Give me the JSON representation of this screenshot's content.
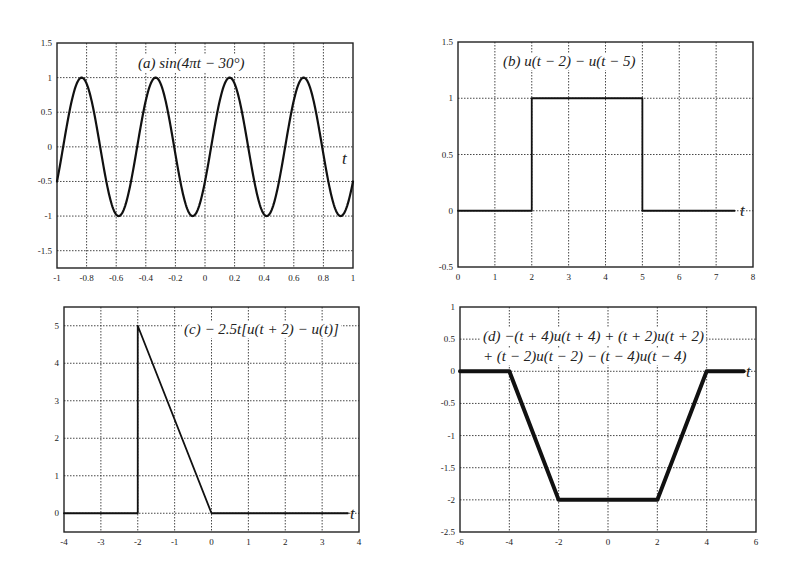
{
  "figure": {
    "background": "#ffffff",
    "line_color": "#111111"
  },
  "chart_data": [
    {
      "id": "a",
      "type": "line",
      "title": "(a) sin(4πt − 30°)",
      "title_prefix": "(a)",
      "title_expr": "sin(4πt − 30°)",
      "xlabel": "t",
      "ylabel": "",
      "xlim": [
        -1,
        1
      ],
      "ylim": [
        -1.75,
        1.5
      ],
      "xticks": [
        -1,
        -0.8,
        -0.6,
        -0.4,
        -0.2,
        0,
        0.2,
        0.4,
        0.6,
        0.8,
        1
      ],
      "xtick_labels": [
        "-1",
        "-0.8",
        "-0.6",
        "-0.4",
        "-0.2",
        "0",
        "0.2",
        "0.4",
        "0.6",
        "0.8",
        "1"
      ],
      "yticks": [
        -1.5,
        -1,
        -0.5,
        0,
        0.5,
        1,
        1.5
      ],
      "ytick_labels": [
        "-1.5",
        "-1",
        "-0.5",
        "0",
        "0.5",
        "1",
        "1.5"
      ],
      "grid": true,
      "function": "sin(4*pi*t - pi/6)",
      "series": [
        {
          "name": "sin(4πt − 30°)",
          "x": [
            -1,
            -0.9167,
            -0.8333,
            -0.75,
            -0.6667,
            -0.5833,
            -0.5,
            -0.4167,
            -0.3333,
            -0.25,
            -0.1667,
            -0.0833,
            0,
            0.0833,
            0.1667,
            0.25,
            0.3333,
            0.4167,
            0.5,
            0.5833,
            0.6667,
            0.75,
            0.8333,
            0.9167,
            1
          ],
          "y": [
            -0.5,
            0.5,
            1,
            0.5,
            -0.5,
            -1,
            -0.5,
            0.5,
            1,
            0.5,
            -0.5,
            -1,
            -0.5,
            0.5,
            1,
            0.5,
            -0.5,
            -1,
            -0.5,
            0.5,
            1,
            0.5,
            -0.5,
            -1,
            -0.5
          ]
        }
      ],
      "box": {
        "x0": 57,
        "y0": 43,
        "x1": 353,
        "y1": 268
      },
      "stroke_width": 2.2,
      "title_pos": {
        "x": 138,
        "y": 68
      },
      "tlabel_pos": {
        "x": 342,
        "y": 164
      }
    },
    {
      "id": "b",
      "type": "line",
      "title": "(b) u(t − 2) − u(t − 5)",
      "title_prefix": "(b)",
      "title_expr": "u(t − 2) − u(t − 5)",
      "xlabel": "t",
      "ylabel": "",
      "xlim": [
        0,
        8
      ],
      "ylim": [
        -0.5,
        1.5
      ],
      "xticks": [
        0,
        1,
        2,
        3,
        4,
        5,
        6,
        7,
        8
      ],
      "xtick_labels": [
        "0",
        "1",
        "2",
        "3",
        "4",
        "5",
        "6",
        "7",
        "8"
      ],
      "yticks": [
        -0.5,
        0,
        0.5,
        1,
        1.5
      ],
      "ytick_labels": [
        "-0.5",
        "0",
        "0.5",
        "1",
        "1.5"
      ],
      "grid": true,
      "series": [
        {
          "name": "u(t−2) − u(t−5)",
          "x": [
            0,
            2,
            2,
            5,
            5,
            7.5
          ],
          "y": [
            0,
            0,
            1,
            1,
            0,
            0
          ]
        }
      ],
      "box": {
        "x0": 458,
        "y0": 42,
        "x1": 753,
        "y1": 267
      },
      "stroke_width": 1.8,
      "title_pos": {
        "x": 503,
        "y": 66
      },
      "tlabel_pos": {
        "x": 740,
        "y": 216
      }
    },
    {
      "id": "c",
      "type": "line",
      "title": "(c) − 2.5t[u(t + 2) − u(t)]",
      "title_prefix": "(c)",
      "title_expr": "− 2.5t[u(t + 2) − u(t)]",
      "xlabel": "t",
      "ylabel": "",
      "xlim": [
        -4,
        4
      ],
      "ylim": [
        -0.5,
        5.5
      ],
      "xticks": [
        -4,
        -3,
        -2,
        -1,
        0,
        1,
        2,
        3,
        4
      ],
      "xtick_labels": [
        "-4",
        "-3",
        "-2",
        "-1",
        "0",
        "1",
        "2",
        "3",
        "4"
      ],
      "yticks": [
        0,
        1,
        2,
        3,
        4,
        5
      ],
      "ytick_labels": [
        "0",
        "1",
        "2",
        "3",
        "4",
        "5"
      ],
      "grid": true,
      "series": [
        {
          "name": "−2.5t[u(t+2) − u(t)]",
          "x": [
            -4,
            -2,
            -2,
            0,
            3.7
          ],
          "y": [
            0,
            0,
            5,
            0,
            0
          ]
        }
      ],
      "box": {
        "x0": 64,
        "y0": 307,
        "x1": 359,
        "y1": 532
      },
      "stroke_width": 1.8,
      "title_pos": {
        "x": 184,
        "y": 334
      },
      "tlabel_pos": {
        "x": 350,
        "y": 519
      }
    },
    {
      "id": "d",
      "type": "line",
      "title": "(d) −(t + 4)u(t + 4) + (t + 2)u(t + 2) + (t − 2)u(t − 2) − (t − 4)u(t − 4)",
      "title_prefix": "(d)",
      "title_expr_line1": "−(t + 4)u(t + 4) + (t + 2)u(t + 2)",
      "title_expr_line2": "+ (t − 2)u(t − 2) − (t − 4)u(t − 4)",
      "xlabel": "t",
      "ylabel": "",
      "xlim": [
        -6,
        6
      ],
      "ylim": [
        -2.5,
        1
      ],
      "xticks": [
        -6,
        -4,
        -2,
        0,
        2,
        4,
        6
      ],
      "xtick_labels": [
        "-6",
        "-4",
        "-2",
        "0",
        "2",
        "4",
        "6"
      ],
      "yticks": [
        -2.5,
        -2,
        -1.5,
        -1,
        -0.5,
        0,
        0.5,
        1
      ],
      "ytick_labels": [
        "-2.5",
        "-2",
        "-1.5",
        "-1",
        "-0.5",
        "0",
        "0.5",
        "1"
      ],
      "grid": true,
      "series": [
        {
          "name": "trapezoid",
          "x": [
            -6,
            -4,
            -2,
            2,
            4,
            5.5
          ],
          "y": [
            0,
            0,
            -2,
            -2,
            0,
            0
          ]
        }
      ],
      "box": {
        "x0": 460,
        "y0": 307,
        "x1": 756,
        "y1": 532
      },
      "stroke_width": 4,
      "title_pos": {
        "x": 483,
        "y": 341
      },
      "title_line2_pos": {
        "x": 483,
        "y": 361
      },
      "tlabel_pos": {
        "x": 746,
        "y": 377
      }
    }
  ]
}
